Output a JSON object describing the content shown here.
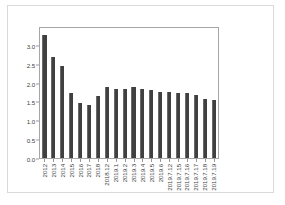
{
  "chart_data": {
    "type": "bar",
    "title": "",
    "subtitle": "",
    "xlabel": "",
    "ylabel": "",
    "ylim": [
      0.0,
      3.5
    ],
    "yticks": [
      "0.0",
      "0.5",
      "1.0",
      "1.5",
      "2.0",
      "2.5",
      "3.0"
    ],
    "ytick_values": [
      0.0,
      0.5,
      1.0,
      1.5,
      2.0,
      2.5,
      3.0
    ],
    "grid": false,
    "legend": null,
    "categories": [
      "2012",
      "2013",
      "2014",
      "2015",
      "2016",
      "2017",
      "2018",
      "2018.12",
      "2019.1",
      "2019.2",
      "2019.3",
      "2019.4",
      "2019.5",
      "2019.6",
      "2019.7.12",
      "2019.7.15",
      "2019.7.16",
      "2019.7.17",
      "2019.7.18",
      "2019.7.19"
    ],
    "values": [
      3.3,
      2.71,
      2.48,
      1.75,
      1.49,
      1.43,
      1.66,
      1.91,
      1.87,
      1.87,
      1.9,
      1.85,
      1.83,
      1.79,
      1.77,
      1.76,
      1.76,
      1.71,
      1.6,
      1.57
    ],
    "bar_color": "#404040",
    "axis_color": "#a6a6a6",
    "frame_color": "#d9d9d9",
    "tick_label_color": "#3f3f3f"
  }
}
